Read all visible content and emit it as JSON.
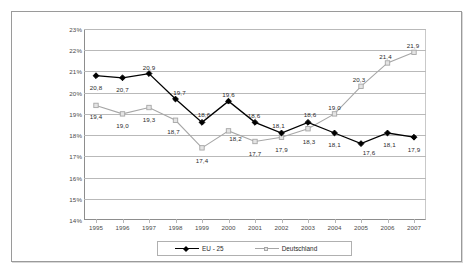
{
  "chart_data": {
    "type": "line",
    "title": "",
    "subtitle": "",
    "xlabel": "",
    "ylabel": "",
    "grid": true,
    "legend_position": "bottom",
    "categories": [
      "1995",
      "1996",
      "1997",
      "1998",
      "1999",
      "2000",
      "2001",
      "2002",
      "2003",
      "2004",
      "2005",
      "2006",
      "2007"
    ],
    "x": [
      1995,
      1996,
      1997,
      1998,
      1999,
      2000,
      2001,
      2002,
      2003,
      2004,
      2005,
      2006,
      2007
    ],
    "ylim": [
      14,
      23
    ],
    "ytick_values": [
      23,
      22,
      21,
      20,
      19,
      18,
      17,
      16,
      15,
      14
    ],
    "ytick_labels": [
      "23%",
      "22%",
      "21%",
      "20%",
      "19%",
      "18%",
      "17%",
      "16%",
      "15%",
      "14%"
    ],
    "series": [
      {
        "name": "EU - 25",
        "color": "#000000",
        "marker": "diamond",
        "values": [
          20.8,
          20.7,
          20.9,
          19.7,
          18.6,
          19.6,
          18.6,
          18.1,
          18.6,
          18.1,
          17.6,
          18.1,
          17.9
        ],
        "labels": [
          "20,8",
          "20,7",
          "20,9",
          "19,7",
          "18,6",
          "19,6",
          "18,6",
          "18,1",
          "18,6",
          "18,1",
          "17,6",
          "18,1",
          "17,9"
        ],
        "label_offsets": [
          {
            "dx": 0,
            "dy": 12
          },
          {
            "dx": 0,
            "dy": 12
          },
          {
            "dx": 0,
            "dy": -6
          },
          {
            "dx": 4,
            "dy": -6
          },
          {
            "dx": 2,
            "dy": -7
          },
          {
            "dx": 0,
            "dy": -6
          },
          {
            "dx": -1,
            "dy": -6
          },
          {
            "dx": -3,
            "dy": -7
          },
          {
            "dx": 2,
            "dy": -7
          },
          {
            "dx": 0,
            "dy": 12
          },
          {
            "dx": 8,
            "dy": 9
          },
          {
            "dx": 2,
            "dy": 12
          },
          {
            "dx": 0,
            "dy": 13
          }
        ]
      },
      {
        "name": "Deutschland",
        "color": "#a6a6a6",
        "marker": "square",
        "values": [
          19.4,
          19.0,
          19.3,
          18.7,
          17.4,
          18.2,
          17.7,
          17.9,
          18.3,
          19.0,
          20.3,
          21.4,
          21.9
        ],
        "labels": [
          "19,4",
          "19,0",
          "19,3",
          "18,7",
          "17,4",
          "18,2",
          "17,7",
          "17,9",
          "18,3",
          "19,0",
          "20,3",
          "21,4",
          "21,9"
        ],
        "label_offsets": [
          {
            "dx": 0,
            "dy": 12
          },
          {
            "dx": 0,
            "dy": 12
          },
          {
            "dx": 0,
            "dy": 12
          },
          {
            "dx": -2,
            "dy": 12
          },
          {
            "dx": 0,
            "dy": 13
          },
          {
            "dx": 7,
            "dy": 8
          },
          {
            "dx": 0,
            "dy": 13
          },
          {
            "dx": 0,
            "dy": 13
          },
          {
            "dx": 1,
            "dy": 13
          },
          {
            "dx": 0,
            "dy": -6
          },
          {
            "dx": -2,
            "dy": -6
          },
          {
            "dx": -2,
            "dy": -6
          },
          {
            "dx": -1,
            "dy": -6
          }
        ]
      }
    ]
  }
}
